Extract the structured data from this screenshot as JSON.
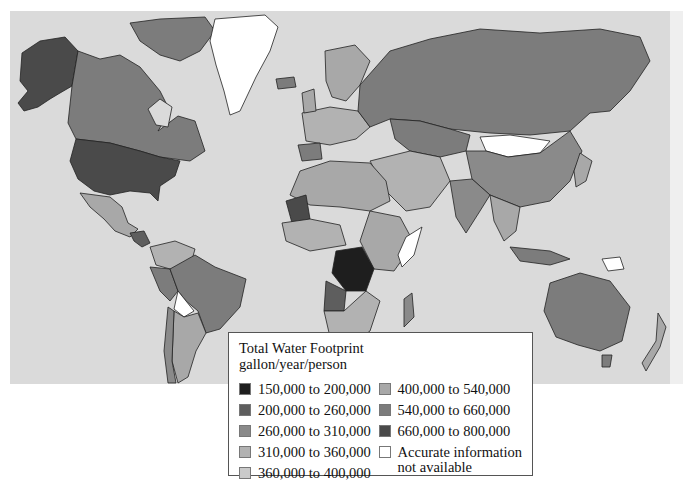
{
  "map": {
    "title": "Total Water Footprint",
    "units": "gallon/year/person",
    "ocean_color": "#dadada",
    "legend": [
      {
        "label": "150,000 to 200,000",
        "color": "#1e1e1e"
      },
      {
        "label": "200,000 to 260,000",
        "color": "#5e5e5e"
      },
      {
        "label": "260,000 to 310,000",
        "color": "#8a8a8a"
      },
      {
        "label": "310,000 to 360,000",
        "color": "#b2b2b2"
      },
      {
        "label": "360,000 to 400,000",
        "color": "#cacaca"
      },
      {
        "label": "400,000 to 540,000",
        "color": "#a8a8a8"
      },
      {
        "label": "540,000 to 660,000",
        "color": "#7c7c7c"
      },
      {
        "label": "660,000 to 800,000",
        "color": "#4a4a4a"
      },
      {
        "label": "Accurate information not available",
        "color": "#ffffff"
      }
    ],
    "regions": [
      {
        "name": "United States",
        "class": "660,000 to 800,000"
      },
      {
        "name": "Canada",
        "class": "540,000 to 660,000"
      },
      {
        "name": "Alaska",
        "class": "660,000 to 800,000"
      },
      {
        "name": "Greenland",
        "class": "Accurate information not available"
      },
      {
        "name": "Mexico",
        "class": "400,000 to 540,000"
      },
      {
        "name": "Brazil",
        "class": "540,000 to 660,000"
      },
      {
        "name": "Bolivia",
        "class": "Accurate information not available"
      },
      {
        "name": "Argentina",
        "class": "400,000 to 540,000"
      },
      {
        "name": "Russia",
        "class": "540,000 to 660,000"
      },
      {
        "name": "Mongolia",
        "class": "Accurate information not available"
      },
      {
        "name": "China",
        "class": "260,000 to 310,000"
      },
      {
        "name": "Kazakhstan",
        "class": "540,000 to 660,000"
      },
      {
        "name": "India",
        "class": "260,000 to 310,000"
      },
      {
        "name": "Australia",
        "class": "540,000 to 660,000"
      },
      {
        "name": "DR Congo",
        "class": "150,000 to 200,000"
      },
      {
        "name": "Mauritania",
        "class": "540,000 to 660,000"
      },
      {
        "name": "Somalia",
        "class": "Accurate information not available"
      },
      {
        "name": "Papua New Guinea",
        "class": "Accurate information not available"
      }
    ]
  }
}
